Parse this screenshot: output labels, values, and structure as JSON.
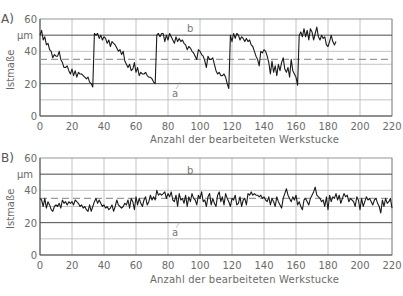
{
  "chart_data": [
    {
      "panel": "A)",
      "type": "line",
      "title": "",
      "xlabel": "Anzahl der bearbeiteten Werkstucke",
      "ylabel": "Istmaße",
      "yunit": "µm",
      "xlim": [
        0,
        220
      ],
      "ylim": [
        0,
        60
      ],
      "xticks": [
        0,
        20,
        40,
        60,
        80,
        100,
        120,
        140,
        160,
        180,
        200,
        220
      ],
      "yticks": [
        0,
        20,
        40,
        60
      ],
      "grid": true,
      "reference_lines": [
        {
          "label": "b",
          "y": 50,
          "style": "solid-dark"
        },
        {
          "label": "",
          "y": 35,
          "style": "dashed"
        },
        {
          "label": "a",
          "y": 20,
          "style": "solid-dark"
        }
      ],
      "annotations": [
        {
          "text": "b",
          "x": 85,
          "y": 53
        },
        {
          "text": "a",
          "x": 82,
          "y": 15
        }
      ],
      "x": [
        0,
        1,
        2,
        3,
        4,
        5,
        6,
        7,
        8,
        9,
        10,
        11,
        12,
        13,
        14,
        15,
        16,
        17,
        18,
        19,
        20,
        21,
        22,
        23,
        24,
        25,
        26,
        27,
        28,
        29,
        30,
        31,
        32,
        33,
        34,
        35,
        36,
        37,
        38,
        39,
        40,
        41,
        42,
        43,
        44,
        45,
        46,
        47,
        48,
        49,
        50,
        51,
        52,
        53,
        54,
        55,
        56,
        57,
        58,
        59,
        60,
        61,
        62,
        63,
        64,
        65,
        66,
        67,
        68,
        69,
        70,
        71,
        72,
        73,
        74,
        75,
        76,
        77,
        78,
        79,
        80,
        81,
        82,
        83,
        84,
        85,
        86,
        87,
        88,
        89,
        90,
        91,
        92,
        93,
        94,
        95,
        96,
        97,
        98,
        99,
        100,
        101,
        102,
        103,
        104,
        105,
        106,
        107,
        108,
        109,
        110,
        111,
        112,
        113,
        114,
        115,
        116,
        117,
        118,
        119,
        120,
        121,
        122,
        123,
        124,
        125,
        126,
        127,
        128,
        129,
        130,
        131,
        132,
        133,
        134,
        135,
        136,
        137,
        138,
        139,
        140,
        141,
        142,
        143,
        144,
        145,
        146,
        147,
        148,
        149,
        150,
        151,
        152,
        153,
        154,
        155,
        156,
        157,
        158,
        159,
        160,
        161,
        162,
        163,
        164,
        165,
        166,
        167,
        168,
        169,
        170,
        171,
        172,
        173,
        174,
        175,
        176,
        177,
        178,
        179,
        180,
        181,
        182,
        183,
        184,
        185
      ],
      "values": [
        50,
        53,
        47,
        49,
        44,
        45,
        41,
        40,
        36,
        38,
        37,
        37,
        40,
        35,
        33,
        30,
        30,
        31,
        28,
        26,
        29,
        25,
        28,
        24,
        27,
        26,
        26,
        25,
        24,
        23,
        24,
        21,
        20,
        18,
        51,
        50,
        51,
        48,
        50,
        47,
        49,
        48,
        45,
        47,
        43,
        46,
        45,
        44,
        42,
        40,
        41,
        38,
        40,
        34,
        32,
        30,
        32,
        28,
        29,
        33,
        27,
        30,
        25,
        27,
        26,
        26,
        27,
        25,
        24,
        24,
        23,
        21,
        20,
        50,
        51,
        49,
        51,
        51,
        46,
        50,
        47,
        51,
        49,
        47,
        45,
        49,
        46,
        48,
        46,
        47,
        45,
        44,
        41,
        43,
        42,
        40,
        39,
        37,
        35,
        41,
        40,
        38,
        37,
        34,
        30,
        37,
        35,
        35,
        36,
        32,
        28,
        26,
        27,
        25,
        25,
        26,
        24,
        20,
        17,
        50,
        46,
        51,
        48,
        51,
        50,
        47,
        49,
        48,
        46,
        48,
        46,
        47,
        44,
        43,
        40,
        37,
        35,
        31,
        40,
        39,
        41,
        40,
        37,
        33,
        26,
        34,
        27,
        31,
        25,
        32,
        28,
        33,
        36,
        29,
        27,
        30,
        24,
        35,
        28,
        26,
        24,
        19,
        50,
        52,
        49,
        54,
        49,
        53,
        47,
        54,
        52,
        47,
        51,
        55,
        49,
        47,
        50,
        48,
        49,
        44,
        43,
        46,
        50,
        46,
        44,
        46,
        36,
        43,
        39,
        47,
        35,
        30,
        38,
        36,
        34,
        40
      ]
    },
    {
      "panel": "B)",
      "type": "line",
      "title": "",
      "xlabel": "Anzahl der bearbeiteten Werkstucke",
      "ylabel": "Istmaße",
      "yunit": "µm",
      "xlim": [
        0,
        220
      ],
      "ylim": [
        0,
        60
      ],
      "xticks": [
        0,
        20,
        40,
        60,
        80,
        100,
        120,
        140,
        160,
        180,
        200,
        220
      ],
      "yticks": [
        0,
        20,
        40,
        60
      ],
      "grid": true,
      "reference_lines": [
        {
          "label": "b",
          "y": 50,
          "style": "solid-dark"
        },
        {
          "label": "",
          "y": 35,
          "style": "dashed"
        },
        {
          "label": "a",
          "y": 20,
          "style": "solid-dark"
        }
      ],
      "annotations": [
        {
          "text": "b",
          "x": 85,
          "y": 53
        },
        {
          "text": "a",
          "x": 82,
          "y": 15
        }
      ],
      "values": [
        35,
        34,
        30,
        35,
        29,
        33,
        31,
        28,
        27,
        30,
        31,
        30,
        32,
        29,
        34,
        32,
        33,
        31,
        33,
        32,
        33,
        31,
        34,
        33,
        32,
        30,
        31,
        29,
        30,
        28,
        27,
        31,
        27,
        30,
        33,
        35,
        32,
        34,
        32,
        30,
        31,
        29,
        30,
        28,
        29,
        31,
        27,
        30,
        34,
        31,
        30,
        29,
        30,
        32,
        31,
        34,
        29,
        35,
        33,
        28,
        36,
        31,
        35,
        32,
        30,
        34,
        36,
        31,
        33,
        37,
        34,
        36,
        34,
        40,
        37,
        38,
        37,
        38,
        39,
        35,
        38,
        36,
        39,
        34,
        33,
        37,
        30,
        38,
        34,
        35,
        32,
        37,
        30,
        36,
        33,
        38,
        35,
        34,
        31,
        37,
        35,
        39,
        33,
        34,
        30,
        36,
        38,
        31,
        35,
        32,
        30,
        37,
        39,
        33,
        36,
        31,
        38,
        35,
        33,
        30,
        35,
        34,
        37,
        31,
        32,
        36,
        30,
        34,
        35,
        31,
        38,
        37,
        39,
        37,
        38,
        37,
        37,
        36,
        37,
        35,
        36,
        34,
        33,
        36,
        31,
        35,
        33,
        30,
        36,
        33,
        31,
        29,
        35,
        38,
        41,
        37,
        35,
        33,
        36,
        34,
        37,
        31,
        33,
        30,
        28,
        34,
        35,
        33,
        31,
        35,
        37,
        39,
        42,
        37,
        36,
        35,
        33,
        34,
        30,
        36,
        28,
        37,
        33,
        36,
        35,
        38,
        34,
        37,
        32,
        35,
        38,
        36,
        37,
        33,
        35,
        34,
        33,
        30,
        36,
        34,
        28,
        35,
        30,
        33,
        36,
        34,
        35,
        33,
        31,
        34,
        35,
        32,
        30,
        26,
        34,
        30,
        35,
        32,
        33,
        35,
        29
      ]
    }
  ],
  "labels": {
    "panelA": "A)",
    "panelB": "B)",
    "ylabel": "Istmaße",
    "yunit": "µm",
    "xlabel": "Anzahl der bearbeiteten Werkstucke",
    "anno_b": "b",
    "anno_a": "a"
  },
  "colors": {
    "line": "#1a1a1a",
    "grid_dark": "#4a4a4a",
    "grid_light": "#b5b5b5",
    "dashed": "#9a9a9a",
    "text": "#6a6a6a"
  }
}
